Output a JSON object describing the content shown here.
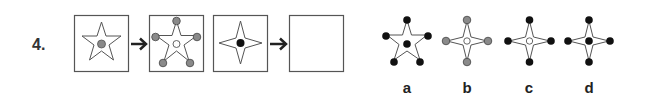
{
  "question": {
    "number": "4.",
    "sequence": [
      {
        "shape": "five-point-star",
        "center_dot": "gray",
        "vertex_dots": "none"
      },
      {
        "shape": "five-point-star",
        "center_dot": "hollow",
        "vertex_dots": "gray"
      },
      {
        "shape": "four-point-star",
        "center_dot": "black",
        "vertex_dots": "none"
      },
      {
        "shape": "empty",
        "center_dot": "none",
        "vertex_dots": "none"
      }
    ],
    "arrows": [
      "arrow-right",
      "arrow-right"
    ]
  },
  "options": [
    {
      "label": "a",
      "shape": "five-point-star",
      "center_dot": "black",
      "vertex_dots": "black"
    },
    {
      "label": "b",
      "shape": "four-point-star",
      "center_dot": "hollow",
      "vertex_dots": "gray"
    },
    {
      "label": "c",
      "shape": "four-point-star",
      "center_dot": "hollow",
      "vertex_dots": "black"
    },
    {
      "label": "d",
      "shape": "four-point-star",
      "center_dot": "black",
      "vertex_dots": "black"
    }
  ],
  "colors": {
    "gray": "#8a8a8a",
    "black": "#111111",
    "line": "#555555"
  }
}
